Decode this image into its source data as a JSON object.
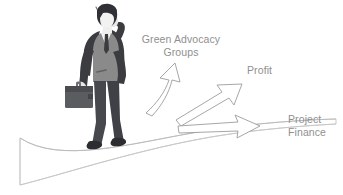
{
  "illustration": {
    "title": "Businessman walking on road with branching arrows",
    "background_color": "#ffffff",
    "labels": {
      "green_advocacy": "Green Advocacy\nGroups",
      "profit": "Profit",
      "project_finance": "Project\nFinance"
    },
    "label_color": "#8f8f8f",
    "arrows": [
      {
        "name": "arrow-green-advocacy",
        "direction": "up",
        "target_label": "Green Advocacy Groups",
        "outline_color": "#9a9a9a",
        "fill_color": "#ffffff"
      },
      {
        "name": "arrow-profit",
        "direction": "up-right",
        "target_label": "Profit",
        "outline_color": "#9a9a9a",
        "fill_color": "#ffffff"
      },
      {
        "name": "arrow-project-finance",
        "direction": "right",
        "target_label": "Project Finance",
        "outline_color": "#9a9a9a",
        "fill_color": "#ffffff"
      }
    ],
    "road": {
      "name": "road-path",
      "outline_color": "#b9b9b9",
      "fill_color": "#ffffff"
    },
    "figure": {
      "name": "businessman",
      "pose": "walking, right hand raised behind head, briefcase in left hand",
      "colors": {
        "hair": "#2f3136",
        "face": "#f2f2f2",
        "jacket": "#3a3c40",
        "vest": "#8a8a8a",
        "tie": "#3a3c40",
        "shirt": "#efefef",
        "trousers": "#46484d",
        "shoes": "#2b2d31",
        "briefcase": "#5a5c60",
        "briefcase_dark": "#3f4145",
        "hand": "#e8e8e8"
      }
    }
  }
}
